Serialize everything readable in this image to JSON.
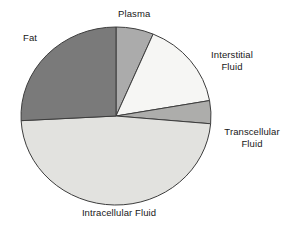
{
  "chart_data": {
    "type": "pie",
    "title": "",
    "subtitle": "",
    "xlabel": "",
    "ylabel": "",
    "legend_position": "none",
    "grid": false,
    "labels_outside": true,
    "center": {
      "cx": 116,
      "cy": 116,
      "rx": 95,
      "ry": 89
    },
    "start_angle_deg": 0,
    "direction": "clockwise",
    "categories": [
      "Plasma",
      "Interstitial Fluid",
      "Transcellular Fluid",
      "Intracellular Fluid",
      "Fat"
    ],
    "values": [
      6,
      16,
      4,
      48,
      26
    ],
    "slices": [
      {
        "name": "plasma",
        "label": "Plasma",
        "value": 6,
        "start_deg": 0,
        "end_deg": 23,
        "color": "#ABABAB",
        "edge_color": "#3d3d3d"
      },
      {
        "name": "interstitial-fluid",
        "label_line1": "Interstitial",
        "label_line2": "Fluid",
        "label": "Interstitial Fluid",
        "value": 16,
        "start_deg": 23,
        "end_deg": 80,
        "color": "#F6F6F4",
        "edge_color": "#3d3d3d"
      },
      {
        "name": "transcellular-fluid",
        "label_line1": "Transcellular",
        "label_line2": "Fluid",
        "label": "Transcellular Fluid",
        "value": 4,
        "start_deg": 80,
        "end_deg": 95,
        "color": "#ADADAB",
        "edge_color": "#3d3d3d"
      },
      {
        "name": "intracellular-fluid",
        "label": "Intracellular Fluid",
        "value": 48,
        "start_deg": 95,
        "end_deg": 267,
        "color": "#E2E2DF",
        "edge_color": "#3d3d3d"
      },
      {
        "name": "fat",
        "label": "Fat",
        "value": 26,
        "start_deg": 267,
        "end_deg": 360,
        "color": "#7A7A7A",
        "edge_color": "#3d3d3d"
      }
    ],
    "colors": {
      "plasma": "#ABABAB",
      "interstitial_fluid": "#F6F6F4",
      "transcellular_fluid": "#ADADAB",
      "intracellular_fluid": "#E2E2DF",
      "fat": "#7A7A7A",
      "outline": "#3d3d3d",
      "background": "#FFFFFF",
      "text": "#171717"
    }
  },
  "labels": {
    "plasma": "Plasma",
    "fat": "Fat",
    "interstitial_line1": "Interstitial",
    "interstitial_line2": "Fluid",
    "transcellular_line1": "Transcellular",
    "transcellular_line2": "Fluid",
    "intracellular": "Intracellular Fluid"
  }
}
